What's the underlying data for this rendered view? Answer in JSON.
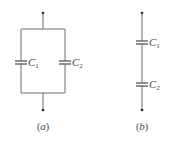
{
  "figure": {
    "a": {
      "caption_open": "(",
      "caption_letter": "a",
      "caption_close": ")",
      "caption": "(a)",
      "arrangement": "parallel",
      "capacitors": [
        {
          "symbol": "C",
          "subscript": "1"
        },
        {
          "symbol": "C",
          "subscript": "2"
        }
      ]
    },
    "b": {
      "caption_open": "(",
      "caption_letter": "b",
      "caption_close": ")",
      "caption": "(b)",
      "arrangement": "series",
      "capacitors": [
        {
          "symbol": "C",
          "subscript": "1"
        },
        {
          "symbol": "C",
          "subscript": "2"
        }
      ]
    }
  },
  "colors": {
    "wire": "#6e6e6e",
    "text": "#444444",
    "terminal": "#222222"
  }
}
